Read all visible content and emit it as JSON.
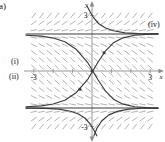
{
  "figure": {
    "panel_label": "a)",
    "type": "direction-field-with-solution-curves"
  },
  "axes": {
    "x_axis_name": "x",
    "y_axis_name": "y",
    "x_ticks": [
      {
        "value": -3,
        "label": "-3"
      },
      {
        "value": -2,
        "label": ""
      },
      {
        "value": -1,
        "label": ""
      },
      {
        "value": 1,
        "label": ""
      },
      {
        "value": 2,
        "label": ""
      },
      {
        "value": 3,
        "label": "3"
      }
    ],
    "y_ticks": [
      {
        "value": 3,
        "label": "3"
      },
      {
        "value": -3,
        "label": "-3"
      }
    ]
  },
  "curve_labels": {
    "i": "(i)",
    "ii": "(ii)",
    "iv": "(iv)"
  },
  "colors": {
    "curve": "#3a3a3a",
    "field": "#9a9a9a",
    "axis": "#8a8a8a",
    "text": "#111111",
    "background": "#ffffff"
  },
  "chart_data": {
    "type": "line",
    "title": "",
    "xlabel": "x",
    "ylabel": "y",
    "xlim": [
      -3.4,
      3.4
    ],
    "ylim": [
      -3.4,
      3.4
    ],
    "grid": false,
    "legend": "none",
    "annotations": [
      {
        "text": "a)",
        "position": "top-left-outside"
      },
      {
        "text": "(i)",
        "position": "left-edge-above-x-axis"
      },
      {
        "text": "(ii)",
        "position": "left-edge-below-x-axis"
      },
      {
        "text": "(iv)",
        "position": "right-edge-upper"
      }
    ],
    "field": {
      "description": "slope field arrows, grid spacing 0.4 in x and y",
      "x_start": -3.0,
      "x_end": 3.0,
      "x_step": 0.4,
      "y_start": -3.0,
      "y_end": 3.0,
      "y_step": 0.4
    },
    "series": [
      {
        "name": "equilibrium-upper",
        "style": "solid",
        "x": [
          -3.4,
          3.4
        ],
        "values": [
          2.0,
          2.0
        ]
      },
      {
        "name": "equilibrium-lower",
        "style": "solid",
        "x": [
          -3.4,
          3.4
        ],
        "values": [
          -2.0,
          -2.0
        ]
      },
      {
        "name": "curve-i-increasing-to-upper",
        "style": "solid",
        "x": [
          -3.4,
          -2.6,
          -2.0,
          -1.4,
          -0.8,
          -0.2,
          0.3,
          0.7,
          1.1,
          1.6,
          2.2,
          3.0,
          3.4
        ],
        "values": [
          -1.93,
          -1.88,
          -1.78,
          -1.58,
          -1.16,
          -0.42,
          0.46,
          1.09,
          1.52,
          1.79,
          1.93,
          1.99,
          2.0
        ]
      },
      {
        "name": "curve-ii-decreasing-to-lower",
        "style": "solid",
        "x": [
          -3.4,
          -2.6,
          -2.0,
          -1.4,
          -0.8,
          -0.2,
          0.3,
          0.7,
          1.1,
          1.6,
          2.2,
          3.0,
          3.4
        ],
        "values": [
          1.93,
          1.88,
          1.78,
          1.58,
          1.16,
          0.42,
          -0.46,
          -1.09,
          -1.52,
          -1.79,
          -1.93,
          -1.99,
          -2.0
        ]
      },
      {
        "name": "curve-iv-upper-branch",
        "style": "solid",
        "x": [
          -0.25,
          -0.1,
          0.1,
          0.35,
          0.7,
          1.1,
          1.7,
          2.4,
          3.1,
          3.4
        ],
        "values": [
          3.5,
          3.2,
          2.85,
          2.55,
          2.32,
          2.17,
          2.06,
          2.02,
          2.0,
          2.0
        ]
      },
      {
        "name": "curve-iv-lower-branch",
        "style": "solid",
        "x": [
          0.25,
          0.1,
          -0.1,
          -0.35,
          -0.7,
          -1.1,
          -1.7,
          -2.4,
          -3.1,
          -3.4
        ],
        "values": [
          -3.5,
          -3.2,
          -2.85,
          -2.55,
          -2.32,
          -2.17,
          -2.06,
          -2.02,
          -2.0,
          -2.0
        ]
      },
      {
        "name": "curve-lower-rising-branch",
        "style": "solid",
        "x": [
          0.1,
          0.25,
          0.5,
          0.85,
          1.3,
          1.9,
          2.6,
          3.2,
          3.4
        ],
        "values": [
          -3.5,
          -3.1,
          -2.7,
          -2.38,
          -2.18,
          -2.06,
          -2.01,
          -2.0,
          -2.0
        ]
      }
    ],
    "marked_points": [
      {
        "x": 0.0,
        "y": 0.0
      },
      {
        "x": 0.62,
        "y": 0.98
      },
      {
        "x": -0.62,
        "y": -0.98
      }
    ]
  }
}
